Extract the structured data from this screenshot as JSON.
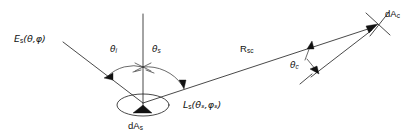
{
  "figure": {
    "kind": "scattering-geometry-diagram",
    "background_color": "#ffffff",
    "line_color": "#1a1a1a"
  },
  "labels": {
    "incident_irradiance": {
      "base": "E",
      "subscript": "s",
      "args": "(θ,φ)",
      "full": "Eₛ(θ,φ)"
    },
    "theta_incident": {
      "base": "θ",
      "subscript": "i",
      "full": "θi"
    },
    "theta_scatter": {
      "base": "θ",
      "subscript": "s",
      "full": "θs"
    },
    "scattered_radiance": {
      "base": "L",
      "subscript": "s",
      "args": "(θₛ,φₛ)",
      "full": "Lₛ(θₛ,φₛ)"
    },
    "source_area": {
      "base": "dA",
      "subscript": "s",
      "full": "dAₛ"
    },
    "distance": {
      "base": "R",
      "subscript": "sc",
      "full": "Rₛᴄ"
    },
    "theta_collection": {
      "base": "θ",
      "subscript": "c",
      "full": "θc"
    },
    "collector_area": {
      "base": "dA",
      "subscript": "c",
      "full": "dAᴄ"
    }
  },
  "geometry": {
    "origin_point": {
      "x": 143,
      "y": 103
    },
    "normal_top": {
      "x": 143,
      "y": 14
    },
    "incident_ray_start": {
      "x": 63,
      "y": 42
    },
    "scatter_ray_end": {
      "x": 378,
      "y": 24
    },
    "collector_point": {
      "x": 378,
      "y": 24
    },
    "surface_ellipse": {
      "cx": 143,
      "cy": 105,
      "rx": 26,
      "ry": 11
    }
  }
}
